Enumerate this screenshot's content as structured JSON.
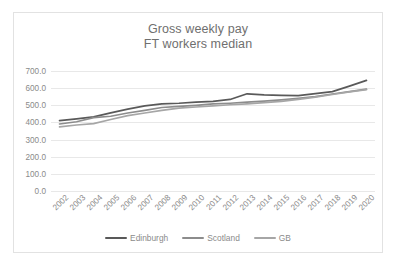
{
  "chart_data": {
    "type": "line",
    "title": "Gross weekly pay FT workers median",
    "title_lines": [
      "Gross weekly pay",
      "FT workers median"
    ],
    "xlabel": "",
    "ylabel": "",
    "ylim": [
      0,
      700
    ],
    "ytick_labels": [
      "700.0",
      "600.0",
      "500.0",
      "400.0",
      "300.0",
      "200.0",
      "100.0",
      "0.0"
    ],
    "ytick_values": [
      700,
      600,
      500,
      400,
      300,
      200,
      100,
      0
    ],
    "grid": true,
    "legend_position": "bottom",
    "categories": [
      "2002",
      "2003",
      "2004",
      "2005",
      "2006",
      "2007",
      "2008",
      "2009",
      "2010",
      "2011",
      "2012",
      "2013",
      "2014",
      "2015",
      "2016",
      "2017",
      "2018",
      "2019",
      "2020"
    ],
    "series": [
      {
        "name": "Edinburgh",
        "color": "#595959",
        "values": [
          410,
          421,
          432,
          456,
          478,
          497,
          508,
          512,
          519,
          523,
          534,
          567,
          561,
          558,
          556,
          568,
          580,
          612,
          645
        ]
      },
      {
        "name": "Scotland",
        "color": "#8c8c8c",
        "values": [
          391,
          404,
          428,
          436,
          455,
          470,
          487,
          494,
          500,
          508,
          512,
          518,
          524,
          531,
          540,
          551,
          566,
          580,
          594
        ]
      },
      {
        "name": "GB",
        "color": "#a6a6a6",
        "values": [
          374,
          385,
          393,
          417,
          440,
          455,
          470,
          483,
          490,
          497,
          503,
          508,
          515,
          523,
          534,
          548,
          563,
          578,
          591
        ]
      }
    ]
  },
  "legend": {
    "items": [
      {
        "label": "Edinburgh",
        "color": "#595959"
      },
      {
        "label": "Scotland",
        "color": "#8c8c8c"
      },
      {
        "label": "GB",
        "color": "#a6a6a6"
      }
    ]
  },
  "colors": {
    "card_border": "#e2e2e2",
    "gridline": "#e8e8e8",
    "tick_text": "#8a8a8a",
    "title_text": "#6f6f6f",
    "background": "#ffffff"
  }
}
